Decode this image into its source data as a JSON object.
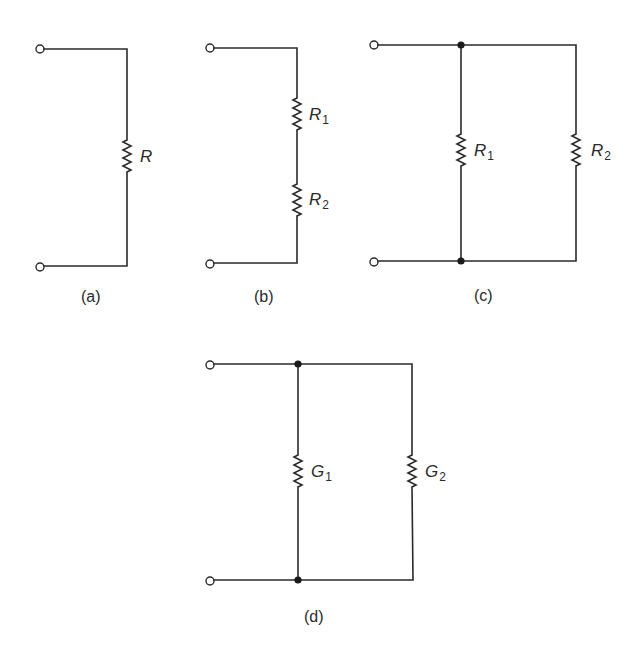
{
  "figure": {
    "colors": {
      "line": "#2a2a2a",
      "node": "#1a1a1a",
      "background": "#ffffff"
    },
    "panels": [
      {
        "id": "a",
        "caption": "(a)",
        "topology": "single",
        "resistors": [
          {
            "symbol": "R",
            "subscript": ""
          }
        ]
      },
      {
        "id": "b",
        "caption": "(b)",
        "topology": "series",
        "resistors": [
          {
            "symbol": "R",
            "subscript": "1"
          },
          {
            "symbol": "R",
            "subscript": "2"
          }
        ]
      },
      {
        "id": "c",
        "caption": "(c)",
        "topology": "parallel",
        "resistors": [
          {
            "symbol": "R",
            "subscript": "1"
          },
          {
            "symbol": "R",
            "subscript": "2"
          }
        ]
      },
      {
        "id": "d",
        "caption": "(d)",
        "topology": "parallel",
        "resistors": [
          {
            "symbol": "G",
            "subscript": "1"
          },
          {
            "symbol": "G",
            "subscript": "2"
          }
        ]
      }
    ]
  }
}
